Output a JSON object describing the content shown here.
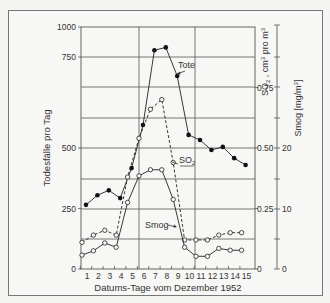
{
  "chart_data": {
    "type": "line",
    "title": "",
    "xlabel": "Datums-Tage vom Dezember 1952",
    "ylabel_left": "Todesfälle pro Tag",
    "ylabel_right_1": "SO2 , cm³ pro m³",
    "ylabel_right_2": "Smog  [mg/m³]",
    "x": [
      1,
      2,
      3,
      4,
      5,
      6,
      7,
      8,
      9,
      10,
      11,
      12,
      13,
      14,
      15
    ],
    "left_ticks": [
      "0",
      "250",
      "500",
      "750",
      "1000"
    ],
    "so2_ticks": [
      "0",
      "0.25",
      "0.50",
      "0.75"
    ],
    "smog_ticks": [
      "0",
      "10",
      "20"
    ],
    "grid": true,
    "series": [
      {
        "name": "Tote",
        "axis": "left",
        "marker": "filled-circle",
        "line": "solid",
        "values": [
          265,
          305,
          325,
          293,
          417,
          563,
          806,
          830,
          698,
          536,
          522,
          492,
          503,
          458,
          430
        ]
      },
      {
        "name": "SO2",
        "axis": "right-so2",
        "marker": "open-circle",
        "line": "dashed",
        "values": [
          0.11,
          0.14,
          0.16,
          0.14,
          0.38,
          0.54,
          0.66,
          0.7,
          0.44,
          0.12,
          0.12,
          0.12,
          0.14,
          0.15,
          0.15
        ]
      },
      {
        "name": "Smog",
        "axis": "right-smog",
        "marker": "open-circle",
        "line": "solid",
        "values": [
          2.3,
          3.0,
          4.3,
          3.6,
          11.0,
          15.4,
          16.4,
          16.4,
          11.5,
          3.6,
          2.1,
          2.1,
          3.4,
          3.1,
          3.1
        ]
      }
    ],
    "annotations": [
      {
        "text": "Tote",
        "near_day": 9
      },
      {
        "text": "SO2",
        "near_day": 9
      },
      {
        "text": "Smog",
        "near_day": 9
      }
    ],
    "axis_notes": "Left axis linear 0–500, compressed 500–1000"
  },
  "labels": {
    "xlabel": "Datums-Tage vom Dezember 1952",
    "ylabel_left": "Todesfälle pro Tag",
    "so2_axis_title": "SO",
    "so2_axis_sub": "2",
    "so2_axis_rest": " , cm",
    "so2_axis_sup": "3",
    "so2_axis_end": " pro m",
    "smog_axis_title": "Smog  [mg/m",
    "smog_axis_end": "]",
    "tote_annotation": "Tote",
    "so2_annotation": "SO",
    "so2_annotation_sub": "2",
    "smog_annotation": "Smog"
  }
}
